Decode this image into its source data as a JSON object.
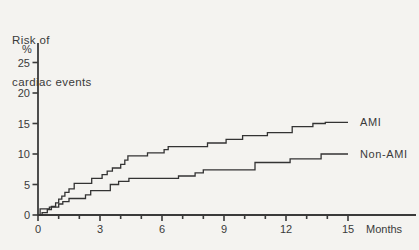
{
  "figure": {
    "title_line1": "Risk of",
    "title_line2": "cardiac events"
  },
  "colors": {
    "ink": "#3a3a3a",
    "curve": "#333333",
    "paper": "#f4f3f0"
  },
  "chart_data": {
    "type": "line",
    "line_style": "step-after",
    "title": "Risk of cardiac events",
    "ylabel": "%",
    "xlabel": "Months",
    "xlim": [
      0,
      15
    ],
    "ylim": [
      0,
      27
    ],
    "x_major_ticks": [
      0,
      3,
      6,
      9,
      12,
      15
    ],
    "x_minor_tick_every": 1,
    "y_ticks": [
      0,
      5,
      10,
      15,
      20,
      25
    ],
    "grid": false,
    "legend_position": "labels-at-line-ends",
    "series": [
      {
        "name": "AMI",
        "label": "AMI",
        "points": [
          [
            0,
            0
          ],
          [
            0.2,
            0.4
          ],
          [
            0.45,
            0.9
          ],
          [
            0.65,
            1.4
          ],
          [
            0.85,
            2.0
          ],
          [
            1.0,
            2.6
          ],
          [
            1.15,
            3.1
          ],
          [
            1.3,
            3.7
          ],
          [
            1.5,
            4.3
          ],
          [
            1.75,
            5.2
          ],
          [
            2.6,
            6.0
          ],
          [
            3.1,
            6.6
          ],
          [
            3.35,
            7.2
          ],
          [
            3.6,
            7.7
          ],
          [
            4.0,
            8.3
          ],
          [
            4.2,
            9.0
          ],
          [
            4.35,
            9.7
          ],
          [
            5.3,
            10.2
          ],
          [
            6.1,
            10.7
          ],
          [
            6.3,
            11.2
          ],
          [
            8.2,
            11.8
          ],
          [
            9.1,
            12.4
          ],
          [
            9.9,
            13.0
          ],
          [
            11.1,
            13.5
          ],
          [
            12.3,
            14.5
          ],
          [
            13.3,
            15.0
          ],
          [
            13.9,
            15.2
          ],
          [
            15,
            15.2
          ]
        ]
      },
      {
        "name": "Non-AMI",
        "label": "Non-AMI",
        "points": [
          [
            0,
            0
          ],
          [
            0.1,
            1.0
          ],
          [
            0.55,
            1.3
          ],
          [
            1.0,
            1.8
          ],
          [
            1.2,
            2.2
          ],
          [
            1.5,
            2.7
          ],
          [
            2.3,
            3.3
          ],
          [
            2.55,
            4.0
          ],
          [
            3.5,
            5.0
          ],
          [
            3.9,
            5.5
          ],
          [
            4.4,
            6.0
          ],
          [
            6.8,
            6.4
          ],
          [
            7.6,
            6.9
          ],
          [
            8.0,
            7.4
          ],
          [
            10.5,
            8.6
          ],
          [
            12.2,
            9.2
          ],
          [
            13.7,
            10.0
          ],
          [
            15,
            10.0
          ]
        ]
      }
    ]
  }
}
